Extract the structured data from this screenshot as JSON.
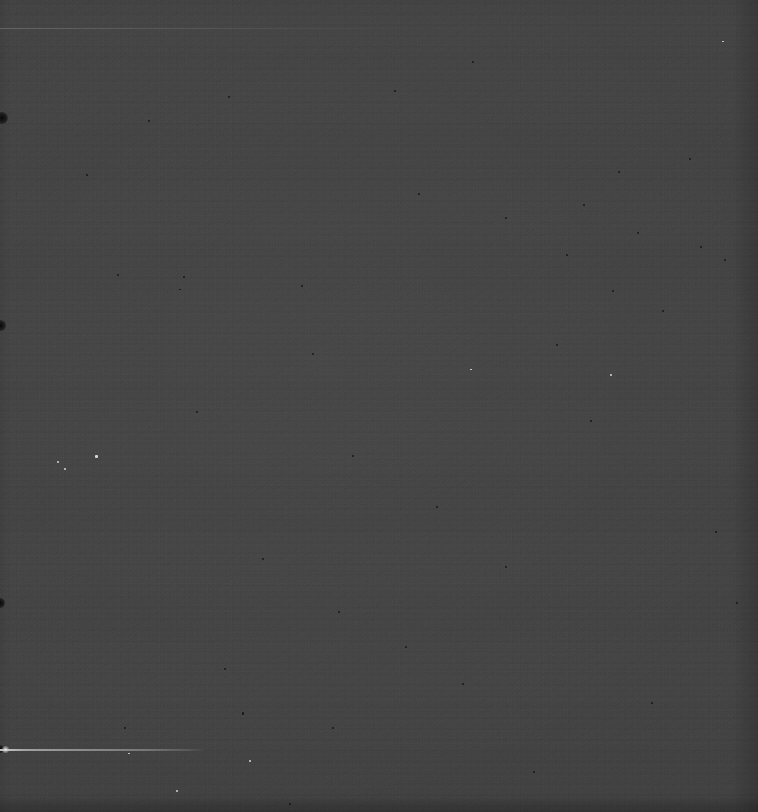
{
  "frame": {
    "label": "raw-detector-frame",
    "width": 758,
    "height": 812,
    "base_color": "#454545",
    "description": "Uniform dark gray sensor field with read noise, horizontal readout banding, pixel defects and a bright linear trail."
  },
  "noise": {
    "fine_label": "fine-read-noise",
    "coarse_label": "coarse-grain-noise",
    "banding_label": "row-readout-banding",
    "macro_label": "broad-row-structure",
    "vignette_label": "flat-field-falloff"
  },
  "edges": {
    "right_label": "right-overscan-strip",
    "bottom_label": "bottom-overscan-strip",
    "left_label": "left-edge-shading"
  },
  "features": {
    "trail": {
      "label": "bright-linear-trail",
      "x": 0,
      "y": 749,
      "length": 206,
      "thickness": 1.6,
      "color": "#e1e1e1"
    },
    "trail_knot": {
      "label": "trail-head-knot",
      "x": 2,
      "y": 746,
      "size": 7,
      "color": "#f5f5f5"
    },
    "faint_line": {
      "label": "faint-upper-line",
      "x": 0,
      "y": 28,
      "length": 430,
      "thickness": 1,
      "color": "#afafaf"
    }
  },
  "hot_pixels": [
    {
      "x": 95,
      "y": 455,
      "w": 3,
      "h": 3
    },
    {
      "x": 64,
      "y": 468,
      "w": 2,
      "h": 2
    },
    {
      "x": 57,
      "y": 461,
      "w": 2,
      "h": 2
    },
    {
      "x": 249,
      "y": 760,
      "w": 2,
      "h": 2
    },
    {
      "x": 128,
      "y": 753,
      "w": 2,
      "h": 1
    },
    {
      "x": 610,
      "y": 374,
      "w": 2,
      "h": 2
    },
    {
      "x": 176,
      "y": 790,
      "w": 2,
      "h": 2
    },
    {
      "x": 470,
      "y": 369,
      "w": 2,
      "h": 1
    },
    {
      "x": 722,
      "y": 41,
      "w": 2,
      "h": 1
    }
  ],
  "dark_pixels": [
    {
      "x": 117,
      "y": 274,
      "w": 2,
      "h": 2
    },
    {
      "x": 183,
      "y": 276,
      "w": 2,
      "h": 2
    },
    {
      "x": 179,
      "y": 289,
      "w": 2,
      "h": 1
    },
    {
      "x": 301,
      "y": 285,
      "w": 2,
      "h": 2
    },
    {
      "x": 242,
      "y": 712,
      "w": 2,
      "h": 3
    },
    {
      "x": 332,
      "y": 727,
      "w": 2,
      "h": 2
    },
    {
      "x": 418,
      "y": 193,
      "w": 2,
      "h": 2
    },
    {
      "x": 505,
      "y": 217,
      "w": 2,
      "h": 2
    },
    {
      "x": 583,
      "y": 204,
      "w": 2,
      "h": 2
    },
    {
      "x": 637,
      "y": 232,
      "w": 2,
      "h": 2
    },
    {
      "x": 700,
      "y": 246,
      "w": 2,
      "h": 2
    },
    {
      "x": 662,
      "y": 310,
      "w": 2,
      "h": 2
    },
    {
      "x": 724,
      "y": 259,
      "w": 2,
      "h": 2
    },
    {
      "x": 612,
      "y": 290,
      "w": 2,
      "h": 2
    },
    {
      "x": 566,
      "y": 254,
      "w": 2,
      "h": 2
    },
    {
      "x": 618,
      "y": 171,
      "w": 2,
      "h": 2
    },
    {
      "x": 689,
      "y": 158,
      "w": 2,
      "h": 2
    },
    {
      "x": 556,
      "y": 344,
      "w": 2,
      "h": 2
    },
    {
      "x": 590,
      "y": 420,
      "w": 2,
      "h": 2
    },
    {
      "x": 505,
      "y": 566,
      "w": 2,
      "h": 2
    },
    {
      "x": 262,
      "y": 558,
      "w": 2,
      "h": 2
    },
    {
      "x": 338,
      "y": 611,
      "w": 2,
      "h": 2
    },
    {
      "x": 405,
      "y": 646,
      "w": 2,
      "h": 2
    },
    {
      "x": 224,
      "y": 668,
      "w": 2,
      "h": 2
    },
    {
      "x": 462,
      "y": 683,
      "w": 2,
      "h": 2
    },
    {
      "x": 148,
      "y": 120,
      "w": 2,
      "h": 2
    },
    {
      "x": 228,
      "y": 96,
      "w": 2,
      "h": 2
    },
    {
      "x": 86,
      "y": 174,
      "w": 2,
      "h": 2
    },
    {
      "x": 352,
      "y": 455,
      "w": 2,
      "h": 2
    },
    {
      "x": 436,
      "y": 506,
      "w": 2,
      "h": 2
    },
    {
      "x": 715,
      "y": 531,
      "w": 2,
      "h": 2
    },
    {
      "x": 736,
      "y": 602,
      "w": 2,
      "h": 2
    },
    {
      "x": 651,
      "y": 702,
      "w": 2,
      "h": 2
    },
    {
      "x": 289,
      "y": 803,
      "w": 2,
      "h": 2
    },
    {
      "x": 533,
      "y": 771,
      "w": 2,
      "h": 2
    },
    {
      "x": 124,
      "y": 727,
      "w": 2,
      "h": 2
    },
    {
      "x": 394,
      "y": 90,
      "w": 2,
      "h": 2
    },
    {
      "x": 472,
      "y": 61,
      "w": 2,
      "h": 2
    },
    {
      "x": 312,
      "y": 353,
      "w": 2,
      "h": 2
    },
    {
      "x": 196,
      "y": 411,
      "w": 2,
      "h": 2
    }
  ],
  "edge_blobs": [
    {
      "label": "edge-blob-upper",
      "x": -4,
      "y": 112,
      "size": 12
    },
    {
      "label": "edge-blob-mid",
      "x": -5,
      "y": 320,
      "size": 11
    },
    {
      "label": "edge-blob-lower",
      "x": -5,
      "y": 598,
      "size": 10
    },
    {
      "label": "edge-blob-bottom",
      "x": -4,
      "y": 745,
      "size": 8
    }
  ]
}
